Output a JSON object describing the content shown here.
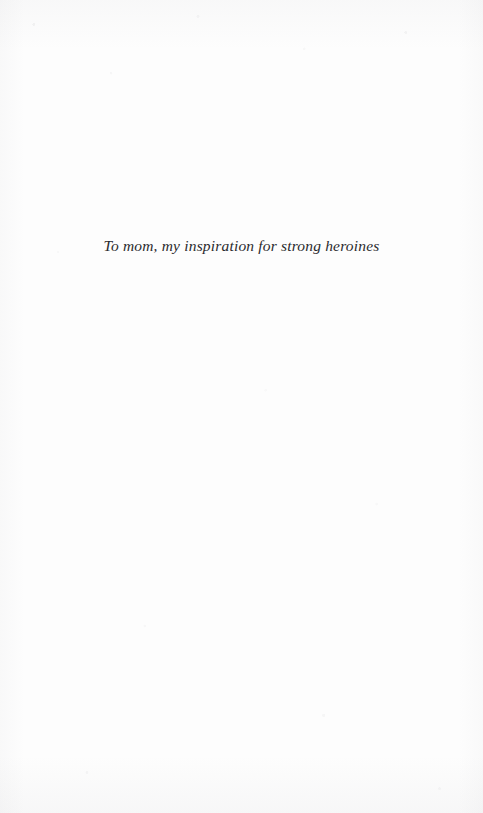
{
  "page": {
    "kind": "book-dedication-page",
    "background_color": "#fdfdfd",
    "width": 483,
    "height": 813
  },
  "dedication": {
    "text": "To mom, my inspiration for strong heroines",
    "text_color": "#2b2b2e",
    "alignment": "center",
    "style": "italic-serif"
  }
}
